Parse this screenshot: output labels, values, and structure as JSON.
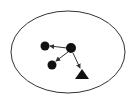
{
  "diagram": {
    "container": {
      "shape": "ellipse",
      "cx": 68,
      "cy": 52,
      "rx": 57,
      "ry": 41,
      "stroke": "#333333"
    },
    "nodes": [
      {
        "id": "center",
        "shape": "circle",
        "x": 71,
        "y": 48,
        "r": 5
      },
      {
        "id": "left",
        "shape": "circle",
        "x": 45,
        "y": 46,
        "r": 4.5
      },
      {
        "id": "lower-left",
        "shape": "circle",
        "x": 52,
        "y": 65,
        "r": 4.5
      },
      {
        "id": "triangle",
        "shape": "triangle",
        "x": 82,
        "y": 74
      }
    ],
    "edges": [
      {
        "from": "center",
        "to": "left"
      },
      {
        "from": "center",
        "to": "lower-left"
      },
      {
        "from": "center",
        "to": "triangle"
      }
    ],
    "colors": {
      "node": "#111111",
      "edge": "#333333"
    }
  }
}
